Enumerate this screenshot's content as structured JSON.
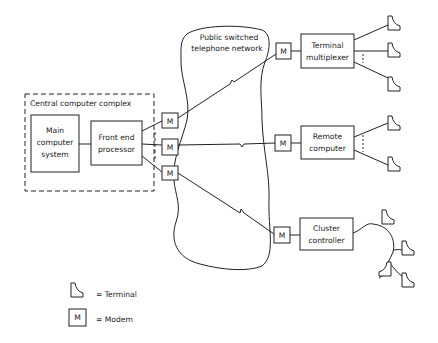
{
  "diagram": {
    "central_complex": {
      "label": "Central computer complex"
    },
    "main_computer": {
      "lines": [
        "Main",
        "computer",
        "system"
      ]
    },
    "front_end": {
      "lines": [
        "Front end",
        "processor"
      ]
    },
    "network": {
      "lines": [
        "Public switched",
        "telephone network"
      ]
    },
    "terminal_multiplexer": {
      "lines": [
        "Terminal",
        "multiplexer"
      ]
    },
    "remote_computer": {
      "lines": [
        "Remote",
        "computer"
      ]
    },
    "cluster_controller": {
      "lines": [
        "Cluster",
        "controller"
      ]
    },
    "modem_label": "M",
    "legend": {
      "terminal": "= Terminal",
      "modem_symbol": "M",
      "modem": "= Modem"
    }
  }
}
